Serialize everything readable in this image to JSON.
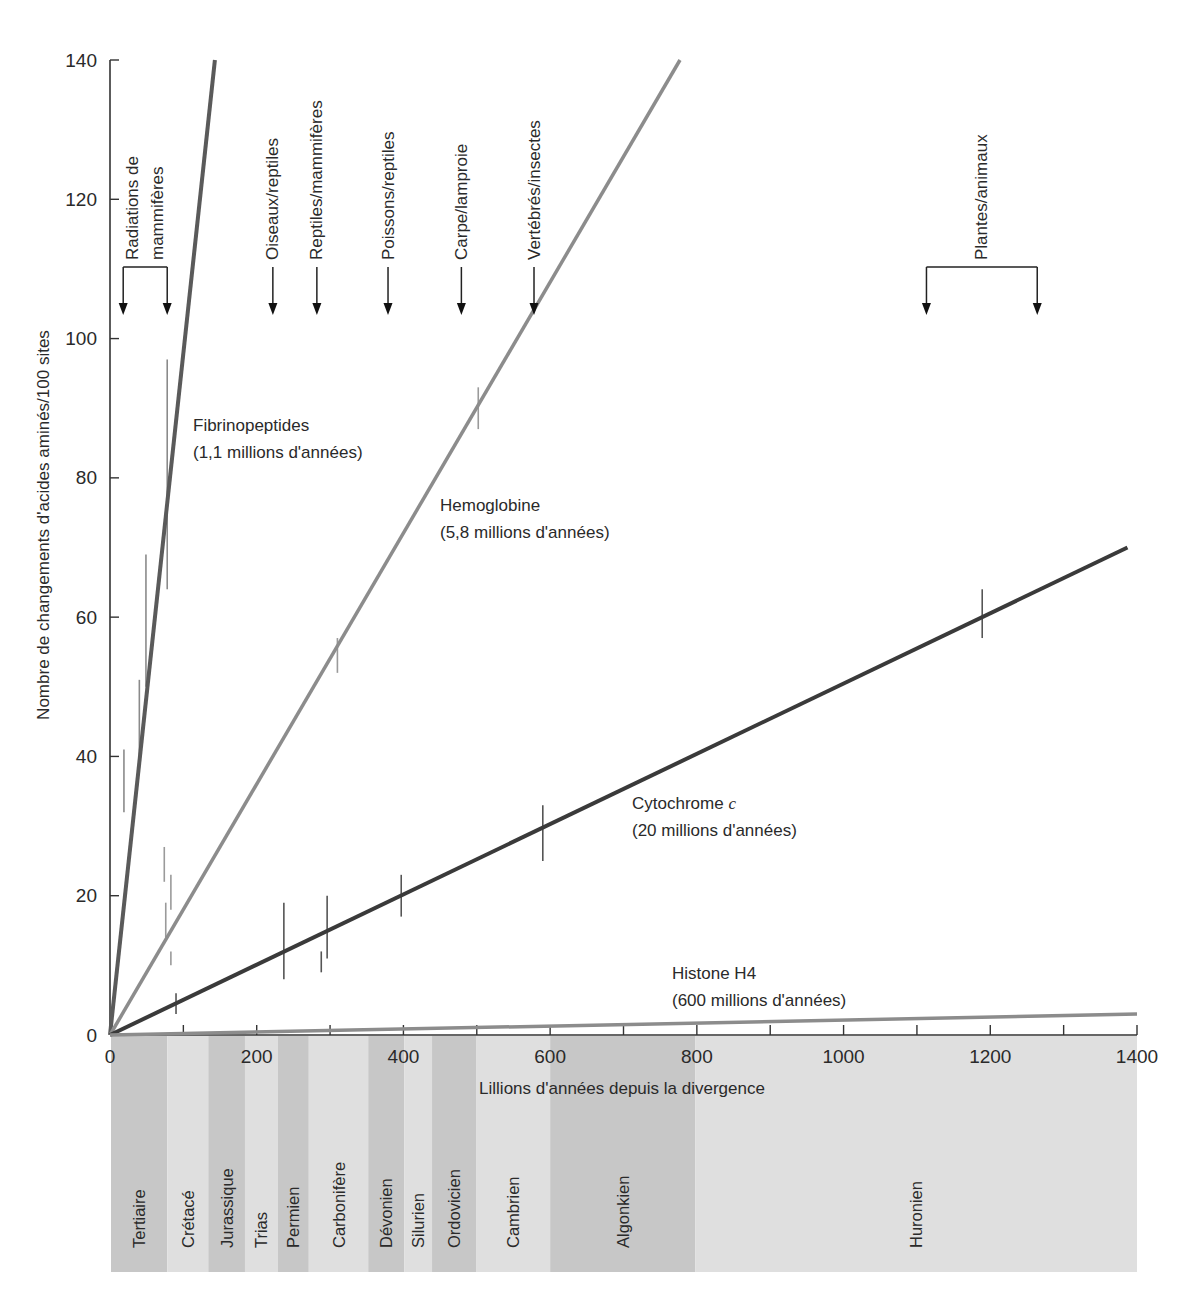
{
  "chart_data": {
    "type": "line",
    "title": "",
    "xlabel": "Lillions d'années depuis la divergence",
    "ylabel": "Nombre de changements d'acides aminés/100 sites",
    "xlim": [
      0,
      1400
    ],
    "ylim": [
      0,
      140
    ],
    "x_ticks": [
      0,
      200,
      400,
      600,
      800,
      1000,
      1200,
      1400
    ],
    "x_tick_labels": [
      "0",
      "200",
      "400",
      "600",
      "800",
      "1000",
      "1200",
      "1400"
    ],
    "x_minor_ticks": [
      100,
      300,
      500,
      700,
      900,
      1100,
      1300
    ],
    "y_ticks": [
      0,
      20,
      40,
      60,
      80,
      100,
      120,
      140
    ],
    "y_tick_labels": [
      "0",
      "20",
      "40",
      "60",
      "80",
      "100",
      "120",
      "140"
    ],
    "grid": false,
    "legend": "none — inline series labels",
    "series": [
      {
        "name": "Fibrinopeptides",
        "note": "(1,1 millions d'années)",
        "color": "#5a5a5a",
        "width": 4,
        "line": [
          [
            0,
            0
          ],
          [
            143,
            140
          ]
        ],
        "error_bar_color": "#8a8a8a",
        "error_bars": [
          [
            19,
            32,
            41
          ],
          [
            40,
            40,
            51
          ],
          [
            49,
            50,
            69
          ],
          [
            78,
            64,
            97
          ]
        ]
      },
      {
        "name": "Hemoglobine",
        "note": "(5,8 millions d'années)",
        "color": "#8c8c8c",
        "width": 3.5,
        "line": [
          [
            0,
            0
          ],
          [
            777,
            140
          ]
        ],
        "error_bar_color": "#9a9a9a",
        "error_bars": [
          [
            74,
            22,
            27
          ],
          [
            76,
            14,
            19
          ],
          [
            83,
            18,
            23
          ],
          [
            83,
            10,
            12
          ],
          [
            310,
            52,
            57
          ],
          [
            502,
            87,
            93
          ]
        ]
      },
      {
        "name": "Cytochrome ",
        "name_italic": "c",
        "note": "(20 millions d'années)",
        "color": "#3a3a3a",
        "width": 4,
        "line": [
          [
            0,
            0
          ],
          [
            1387,
            70
          ]
        ],
        "error_bar_color": "#555555",
        "error_bars": [
          [
            90,
            3,
            6
          ],
          [
            237,
            8,
            19
          ],
          [
            288,
            9,
            12
          ],
          [
            296,
            11,
            20
          ],
          [
            397,
            17,
            23
          ],
          [
            590,
            25,
            33
          ],
          [
            1189,
            57,
            64
          ]
        ]
      },
      {
        "name": "Histone H4",
        "note": "(600 millions d'années)",
        "color": "#8c8c8c",
        "width": 3.5,
        "line": [
          [
            0,
            0
          ],
          [
            1400,
            3
          ]
        ],
        "error_bar_color": "#9a9a9a",
        "error_bars": []
      }
    ],
    "divergences": [
      {
        "lines": [
          "Radiations de",
          "mammifères"
        ],
        "range": [
          18,
          78
        ]
      },
      {
        "lines": [
          "Oiseaux/reptiles"
        ],
        "at": 222
      },
      {
        "lines": [
          "Reptiles/mammifères"
        ],
        "at": 282
      },
      {
        "lines": [
          "Poissons/reptiles"
        ],
        "at": 379
      },
      {
        "lines": [
          "Carpe/lamproie"
        ],
        "at": 479
      },
      {
        "lines": [
          "Vertébrés/insectes"
        ],
        "at": 578
      },
      {
        "lines": [
          "Plantes/animaux"
        ],
        "range": [
          1113,
          1264
        ]
      }
    ],
    "periods": [
      {
        "name": "Tertiaire",
        "start": 0,
        "end": 78,
        "shade": "dark"
      },
      {
        "name": "Crétacé",
        "start": 78,
        "end": 134,
        "shade": "light"
      },
      {
        "name": "Jurassique",
        "start": 134,
        "end": 184,
        "shade": "dark"
      },
      {
        "name": "Trias",
        "start": 184,
        "end": 229,
        "shade": "light"
      },
      {
        "name": "Permien",
        "start": 229,
        "end": 271,
        "shade": "dark"
      },
      {
        "name": "Carbonifère",
        "start": 271,
        "end": 352,
        "shade": "light"
      },
      {
        "name": "Dévonien",
        "start": 352,
        "end": 401,
        "shade": "dark"
      },
      {
        "name": "Silurien",
        "start": 401,
        "end": 439,
        "shade": "light"
      },
      {
        "name": "Ordovicien",
        "start": 439,
        "end": 499,
        "shade": "dark"
      },
      {
        "name": "Cambrien",
        "start": 499,
        "end": 600,
        "shade": "light"
      },
      {
        "name": "Algonkien",
        "start": 600,
        "end": 798,
        "shade": "dark"
      },
      {
        "name": "Huronien",
        "start": 798,
        "end": 1400,
        "shade": "light"
      }
    ],
    "shade_colors": {
      "dark": "#c7c7c7",
      "light": "#dfdfdf"
    },
    "axis_color": "#333333"
  }
}
